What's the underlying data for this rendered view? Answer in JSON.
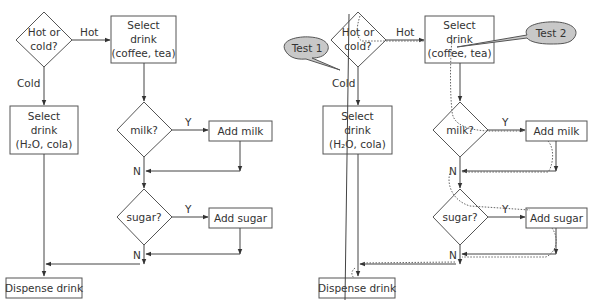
{
  "diagram": {
    "left": {
      "hot_or_cold": [
        "Hot or",
        "cold?"
      ],
      "hot_label": "Hot",
      "cold_label": "Cold",
      "select_hot": [
        "Select",
        "drink",
        "(coffee, tea)"
      ],
      "select_cold": [
        "Select",
        "drink",
        "(H₂O, cola)"
      ],
      "milk_q": "milk?",
      "add_milk": "Add milk",
      "sugar_q": "sugar?",
      "add_sugar": "Add sugar",
      "yes_label": "Y",
      "no_label": "N",
      "dispense": "Dispense drink"
    },
    "right": {
      "hot_or_cold": [
        "Hot or",
        "cold?"
      ],
      "hot_label": "Hot",
      "cold_label": "Cold",
      "select_hot": [
        "Select",
        "drink",
        "(coffee, tea)"
      ],
      "select_cold": [
        "Select",
        "drink",
        "(H₂O, cola)"
      ],
      "milk_q": "milk?",
      "add_milk": "Add milk",
      "sugar_q": "sugar?",
      "add_sugar": "Add sugar",
      "yes_label": "Y",
      "no_label": "N",
      "dispense": "Dispense drink",
      "callouts": {
        "test1": "Test 1",
        "test2": "Test 2"
      }
    }
  }
}
